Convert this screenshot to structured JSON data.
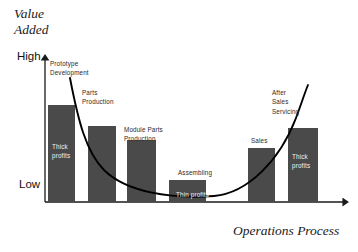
{
  "titles": {
    "value_axis": "Value\nAdded",
    "process_axis": "Operations Process"
  },
  "scale": {
    "high": "High",
    "low": "Low"
  },
  "colors": {
    "bar_fill": "#4a4a4a",
    "axis": "#1a1a1a",
    "curve": "#000000",
    "background": "#ffffff",
    "inside_label": "#f2f2f2"
  },
  "chart_data": {
    "type": "bar",
    "title": "Value Added",
    "xlabel": "Operations Process",
    "ylabel": "Value Added",
    "ytick_labels": [
      "High",
      "Low"
    ],
    "ylim": [
      0,
      100
    ],
    "grid": false,
    "legend": false,
    "categories": [
      "Prototype Development",
      "Parts Production",
      "Module Parts Production",
      "Assembling",
      "Sales",
      "After Sales Servicing"
    ],
    "values": [
      67,
      53,
      44,
      24,
      37,
      51
    ],
    "annotations": [
      "Thick profits",
      "Thin profits",
      "Thick profits"
    ],
    "overlay_curve": {
      "name": "Smile Curve",
      "shape": "u-curve",
      "description": "Profit margin curve, high at both ends and low in the middle"
    }
  },
  "bars": [
    {
      "id": "prototype-development",
      "caption": "Prototype\nDevelopment",
      "caption_x": 50,
      "caption_y": 59,
      "x": 48,
      "width": 27,
      "top": 105,
      "inside_label": "Thick\nprofits",
      "inside_x": 52,
      "inside_y": 142
    },
    {
      "id": "parts-production",
      "caption": "Parts\nProduction",
      "caption_x": 82,
      "caption_y": 88,
      "x": 88,
      "width": 28,
      "top": 126,
      "inside_label": "",
      "inside_x": 0,
      "inside_y": 0
    },
    {
      "id": "module-parts-production",
      "caption": "Module Parts\nProduction",
      "caption_x": 124,
      "caption_y": 125,
      "x": 127,
      "width": 29,
      "top": 140,
      "inside_label": "",
      "inside_x": 0,
      "inside_y": 0
    },
    {
      "id": "assembling",
      "caption": "Assembling",
      "caption_x": 178,
      "caption_y": 168,
      "x": 169,
      "width": 37,
      "top": 180,
      "inside_label": "Thin profits",
      "inside_x": 176,
      "inside_y": 190
    },
    {
      "id": "sales",
      "caption": "Sales",
      "caption_x": 251,
      "caption_y": 136,
      "x": 248,
      "width": 27,
      "top": 148,
      "inside_label": "",
      "inside_x": 0,
      "inside_y": 0
    },
    {
      "id": "after-sales-servicing",
      "caption": "After\nSales\nServicing",
      "caption_x": 272,
      "caption_y": 88,
      "x": 288,
      "width": 30,
      "top": 128,
      "inside_label": "Thick\nprofits",
      "inside_x": 292,
      "inside_y": 152
    }
  ],
  "geometry": {
    "baseline_y": 202,
    "axis_x": 45,
    "axis_top_y": 57,
    "axis_right_x": 350
  }
}
